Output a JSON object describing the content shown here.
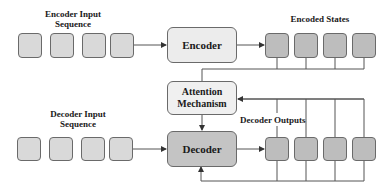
{
  "labels": {
    "encoder_input_line1": "Encoder Input",
    "encoder_input_line2": "Sequence",
    "encoded_states": "Encoded States",
    "decoder_input_line1": "Decoder Input",
    "decoder_input_line2": "Sequence",
    "decoder_outputs": "Decoder Outputs"
  },
  "blocks": {
    "encoder": "Encoder",
    "attention_line1": "Attention",
    "attention_line2": "Mechanism",
    "decoder": "Decoder"
  },
  "counts": {
    "encoder_input_tokens": 4,
    "encoded_states": 4,
    "decoder_input_tokens": 4,
    "decoder_outputs": 4
  },
  "colors": {
    "input_token": "#d9d9d9",
    "state_token": "#bdbdbd",
    "encoder_fill": "#ececec",
    "attention_fill": "#f0f0f0",
    "decoder_fill": "#c4c4c4",
    "stroke": "#555555"
  }
}
